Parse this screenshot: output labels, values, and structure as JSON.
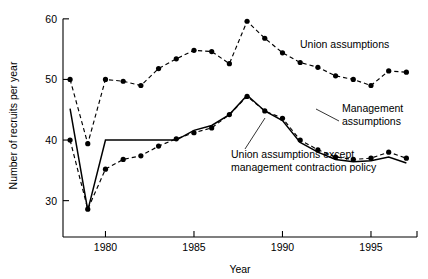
{
  "chart_data": {
    "type": "line",
    "title": "",
    "xlabel": "Year",
    "ylabel": "Number of recruits per year",
    "xlim": [
      1977.6,
      1997.6
    ],
    "ylim": [
      24.0,
      60.8
    ],
    "xticks": [
      1980,
      1985,
      1990,
      1995
    ],
    "xticklabels": [
      "1980",
      "1985",
      "1990",
      "1995"
    ],
    "yticks": [
      30,
      40,
      50,
      60
    ],
    "yticklabels": [
      "30",
      "40",
      "50",
      "60"
    ],
    "grid": false,
    "legend_position": "inline-annotations",
    "x": [
      1978,
      1979,
      1980,
      1981,
      1982,
      1983,
      1984,
      1985,
      1986,
      1987,
      1988,
      1989,
      1990,
      1991,
      1992,
      1993,
      1994,
      1995,
      1996,
      1997
    ],
    "series": [
      {
        "name": "Union assumptions",
        "style": "dashed-with-markers",
        "values": [
          50.0,
          39.4,
          50.0,
          49.7,
          49.0,
          51.8,
          53.4,
          54.8,
          54.6,
          52.6,
          59.6,
          56.8,
          54.4,
          52.8,
          52.0,
          50.6,
          50.0,
          49.0,
          51.4,
          51.2
        ]
      },
      {
        "name": "Management assumptions",
        "style": "dashed-with-markers",
        "values": [
          40.0,
          28.6,
          35.2,
          36.8,
          37.4,
          39.0,
          40.2,
          41.2,
          42.0,
          44.2,
          47.2,
          44.8,
          43.6,
          40.0,
          38.4,
          37.2,
          36.8,
          37.0,
          38.0,
          37.0
        ]
      },
      {
        "name": "Union assumptions except management contraction policy",
        "style": "solid",
        "values": [
          45.2,
          28.4,
          40.0,
          40.0,
          40.0,
          40.0,
          40.0,
          41.6,
          42.4,
          44.2,
          47.4,
          44.8,
          43.2,
          39.6,
          38.0,
          36.8,
          36.4,
          36.6,
          37.2,
          36.2
        ]
      }
    ],
    "annotations": [
      {
        "name": "union-assumptions-label",
        "text": "Union assumptions",
        "x_px": 300,
        "y_px": 48,
        "leader": false
      },
      {
        "name": "management-assumptions-label",
        "text": "Management",
        "text2": "assumptions",
        "x_px": 342,
        "y_px": 112,
        "leader": true
      },
      {
        "name": "union-except-contraction-label",
        "text": "Union assumptions except",
        "text2": "management contraction policy",
        "x_px": 231,
        "y_px": 158,
        "leader": true
      }
    ]
  },
  "axes": {
    "y_title": "Number of recruits per year",
    "x_title": "Year"
  }
}
